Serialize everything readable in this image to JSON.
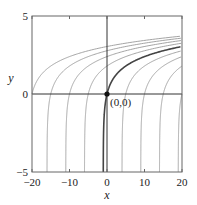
{
  "chart_data": {
    "type": "line",
    "title": "",
    "xlabel": "x",
    "ylabel": "y",
    "xlim": [
      -20,
      20
    ],
    "ylim": [
      -5,
      5
    ],
    "grid": false,
    "legend": null,
    "x_ticks": [
      -20,
      -10,
      0,
      10,
      20
    ],
    "x_tick_labels": [
      "−20",
      "−10",
      "0",
      "10",
      "20"
    ],
    "y_ticks": [
      -5,
      0,
      5
    ],
    "y_tick_labels": [
      "−5",
      "0",
      "5"
    ],
    "family_description": "Solution curves x = e^y + C (y = ln(x - C))",
    "series": [
      {
        "name": "C=-21",
        "C": -21,
        "highlight": false
      },
      {
        "name": "C=-16",
        "C": -16,
        "highlight": false
      },
      {
        "name": "C=-11",
        "C": -11,
        "highlight": false
      },
      {
        "name": "C=-6",
        "C": -6,
        "highlight": false
      },
      {
        "name": "C=-1 (through origin)",
        "C": -1,
        "highlight": true
      },
      {
        "name": "C=4",
        "C": 4,
        "highlight": false
      },
      {
        "name": "C=9",
        "C": 9,
        "highlight": false
      },
      {
        "name": "C=14",
        "C": 14,
        "highlight": false
      },
      {
        "name": "C=19",
        "C": 19,
        "highlight": false
      }
    ],
    "annotations": [
      {
        "text": "(0,0)",
        "x": 0,
        "y": 0,
        "marker": "filled-circle"
      }
    ],
    "colors": {
      "curve": "#9a9a9a",
      "highlight": "#444444",
      "axis": "#333333",
      "frame": "#666666"
    }
  }
}
